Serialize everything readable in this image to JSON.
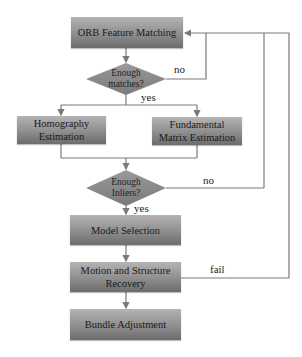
{
  "nodes": {
    "orb": {
      "label": "ORB Feature Matching"
    },
    "matches_check": {
      "label_line1": "Enough",
      "label_line2": "matches?"
    },
    "homography": {
      "label_line1": "Homography",
      "label_line2": "Estimation"
    },
    "fundamental": {
      "label_line1": "Fundamental",
      "label_line2": "Matrix Estimation"
    },
    "inliers_check": {
      "label_line1": "Enough",
      "label_line2": "Inliers?"
    },
    "model_selection": {
      "label": "Model Selection"
    },
    "motion_structure": {
      "label_line1": "Motion and Structure",
      "label_line2": "Recovery"
    },
    "bundle": {
      "label": "Bundle Adjustment"
    }
  },
  "edges": {
    "matches_no": "no",
    "matches_yes": "yes",
    "inliers_no": "no",
    "inliers_yes": "yes",
    "motion_fail": "fail"
  },
  "colors": {
    "line": "#7a7a7a",
    "box_top": "#b4b4b4",
    "box_bottom": "#6c6c6c",
    "diamond": "#8a8a8a"
  }
}
